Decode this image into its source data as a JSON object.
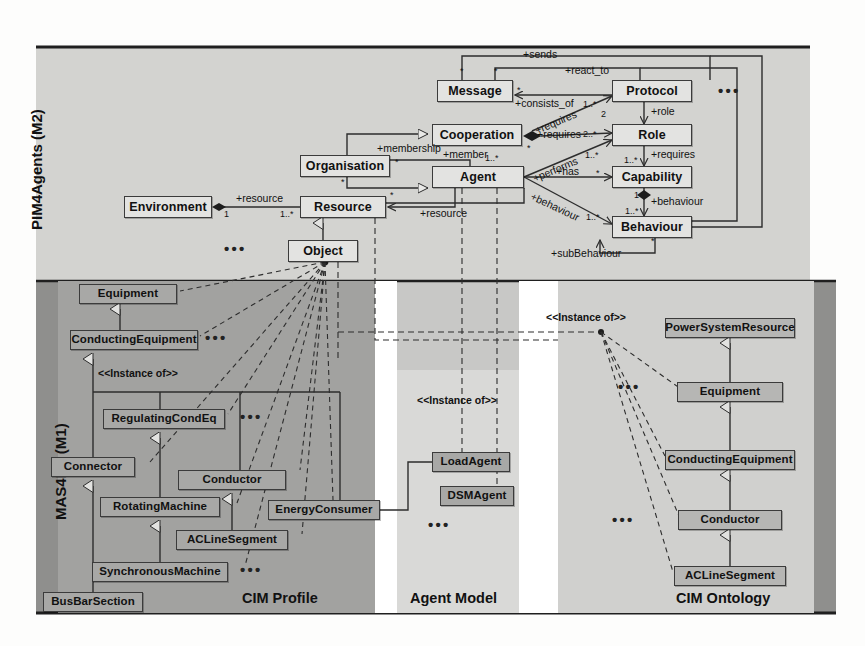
{
  "figure": {
    "layers": [
      {
        "id": "m2",
        "label": "PIM4Agents (M2)"
      },
      {
        "id": "m1",
        "label": "MAS4ES (M1)"
      }
    ],
    "panels": [
      {
        "id": "cim-profile",
        "title": "CIM Profile"
      },
      {
        "id": "agent-model",
        "title": "Agent Model"
      },
      {
        "id": "cim-ontology",
        "title": "CIM Ontology"
      }
    ]
  },
  "m2": {
    "classes": [
      {
        "id": "environment",
        "label": "Environment",
        "x": 124,
        "y": 196,
        "w": 88,
        "h": 22
      },
      {
        "id": "resource",
        "label": "Resource",
        "x": 300,
        "y": 196,
        "w": 86,
        "h": 22
      },
      {
        "id": "object",
        "label": "Object",
        "x": 288,
        "y": 240,
        "w": 70,
        "h": 22
      },
      {
        "id": "organisation",
        "label": "Organisation",
        "x": 300,
        "y": 155,
        "w": 90,
        "h": 22
      },
      {
        "id": "cooperation",
        "label": "Cooperation",
        "x": 432,
        "y": 124,
        "w": 90,
        "h": 22
      },
      {
        "id": "agent",
        "label": "Agent",
        "x": 432,
        "y": 166,
        "w": 92,
        "h": 22
      },
      {
        "id": "message",
        "label": "Message",
        "x": 437,
        "y": 80,
        "w": 76,
        "h": 22
      },
      {
        "id": "protocol",
        "label": "Protocol",
        "x": 612,
        "y": 80,
        "w": 80,
        "h": 22
      },
      {
        "id": "role",
        "label": "Role",
        "x": 612,
        "y": 124,
        "w": 80,
        "h": 22
      },
      {
        "id": "capability",
        "label": "Capability",
        "x": 612,
        "y": 166,
        "w": 80,
        "h": 22
      },
      {
        "id": "behaviour",
        "label": "Behaviour",
        "x": 612,
        "y": 216,
        "w": 80,
        "h": 22
      }
    ],
    "association_labels": [
      {
        "id": "sends",
        "text": "+sends",
        "x": 523,
        "y": 55
      },
      {
        "id": "react-to",
        "text": "+react_to",
        "x": 565,
        "y": 71
      },
      {
        "id": "consists-of",
        "text": "+consists_of",
        "x": 515,
        "y": 96
      },
      {
        "id": "requires-coop",
        "text": "+requires",
        "x": 498,
        "y": 108,
        "rotate": -22
      },
      {
        "id": "membership",
        "text": "+membership",
        "x": 377,
        "y": 143
      },
      {
        "id": "member",
        "text": "+member",
        "x": 442,
        "y": 147
      },
      {
        "id": "requires-role",
        "text": "+requires",
        "x": 537,
        "y": 134
      },
      {
        "id": "role-lbl",
        "text": "+role",
        "x": 651,
        "y": 111
      },
      {
        "id": "requires-cap",
        "text": "+requires",
        "x": 651,
        "y": 153
      },
      {
        "id": "performs",
        "text": "+performs",
        "x": 553,
        "y": 156,
        "rotate": -22
      },
      {
        "id": "has",
        "text": "+has",
        "x": 562,
        "y": 170
      },
      {
        "id": "behaviour-lnk",
        "text": "+behaviour",
        "x": 555,
        "y": 196,
        "rotate": 22
      },
      {
        "id": "behaviour-agg",
        "text": "+behaviour",
        "x": 650,
        "y": 201
      },
      {
        "id": "subbehaviour",
        "text": "+subBehaviour",
        "x": 560,
        "y": 244
      },
      {
        "id": "resource-env",
        "text": "+resource",
        "x": 240,
        "y": 192
      },
      {
        "id": "resource-ag",
        "text": "+resource",
        "x": 420,
        "y": 210
      }
    ],
    "multiplicities": [
      {
        "id": "env-1",
        "text": "1",
        "x": 222,
        "y": 210
      },
      {
        "id": "res-1n",
        "text": "1..*",
        "x": 283,
        "y": 210
      },
      {
        "id": "msg-star-a",
        "text": "*",
        "x": 466,
        "y": 70
      },
      {
        "id": "msg-star-b",
        "text": "*",
        "x": 500,
        "y": 70
      },
      {
        "id": "msg-star-c",
        "text": "*",
        "x": 516,
        "y": 88
      },
      {
        "id": "prot-req",
        "text": "1..*",
        "x": 586,
        "y": 103
      },
      {
        "id": "coop-star",
        "text": "*",
        "x": 527,
        "y": 146
      },
      {
        "id": "role-2n",
        "text": "2..*",
        "x": 585,
        "y": 134
      },
      {
        "id": "role-2",
        "text": "2",
        "x": 601,
        "y": 113
      },
      {
        "id": "role-1n",
        "text": "1..*",
        "x": 587,
        "y": 152
      },
      {
        "id": "cap-req-1n",
        "text": "1..*",
        "x": 601,
        "y": 156
      },
      {
        "id": "cap-star",
        "text": "*",
        "x": 597,
        "y": 170
      },
      {
        "id": "cap-1",
        "text": "1",
        "x": 638,
        "y": 190
      },
      {
        "id": "beh-1n-a",
        "text": "1..*",
        "x": 632,
        "y": 208
      },
      {
        "id": "beh-1n-b",
        "text": "1..*",
        "x": 587,
        "y": 214
      },
      {
        "id": "beh-star",
        "text": "*",
        "x": 653,
        "y": 236
      },
      {
        "id": "agent-1n",
        "text": "1..*",
        "x": 487,
        "y": 157
      },
      {
        "id": "org-star-a",
        "text": "*",
        "x": 396,
        "y": 160
      },
      {
        "id": "org-star-b",
        "text": "*",
        "x": 341,
        "y": 180
      },
      {
        "id": "res-star",
        "text": "*",
        "x": 391,
        "y": 192
      }
    ],
    "ellipses": [
      {
        "id": "m2-dots-right",
        "x": 722,
        "y": 88
      },
      {
        "id": "m2-dots-obj",
        "x": 228,
        "y": 246
      }
    ]
  },
  "m1": {
    "cim_profile": {
      "classes": [
        {
          "id": "equipment",
          "label": "Equipment",
          "x": 79,
          "y": 284,
          "w": 98,
          "h": 20
        },
        {
          "id": "conducting-equipment",
          "label": "ConductingEquipment",
          "x": 70,
          "y": 330,
          "w": 128,
          "h": 20
        },
        {
          "id": "regulating-condeq",
          "label": "RegulatingCondEq",
          "x": 103,
          "y": 409,
          "w": 122,
          "h": 20
        },
        {
          "id": "connector",
          "label": "Connector",
          "x": 65,
          "y": 457,
          "w": 84,
          "h": 20
        },
        {
          "id": "conductor",
          "label": "Conductor",
          "x": 187,
          "y": 470,
          "w": 108,
          "h": 20
        },
        {
          "id": "rotating-machine",
          "label": "RotatingMachine",
          "x": 112,
          "y": 497,
          "w": 120,
          "h": 20
        },
        {
          "id": "energy-consumer",
          "label": "EnergyConsumer",
          "x": 270,
          "y": 500,
          "w": 110,
          "h": 20
        },
        {
          "id": "acline-segment",
          "label": "ACLineSegment",
          "x": 185,
          "y": 530,
          "w": 112,
          "h": 20
        },
        {
          "id": "synchronous-machine",
          "label": "SynchronousMachine",
          "x": 105,
          "y": 562,
          "w": 136,
          "h": 20
        },
        {
          "id": "busbar-section",
          "label": "BusBarSection",
          "x": 70,
          "y": 592,
          "w": 100,
          "h": 20
        }
      ],
      "stereotype": {
        "text": "<<Instance of>>",
        "x": 98,
        "y": 373
      },
      "ellipses": [
        {
          "id": "dots-ce",
          "x": 208,
          "y": 334
        },
        {
          "id": "dots-rce",
          "x": 243,
          "y": 410
        },
        {
          "id": "dots-sm",
          "x": 250,
          "y": 566
        }
      ]
    },
    "agent_model": {
      "classes": [
        {
          "id": "load-agent",
          "label": "LoadAgent",
          "x": 432,
          "y": 452,
          "w": 76,
          "h": 20
        },
        {
          "id": "dsm-agent",
          "label": "DSMAgent",
          "x": 440,
          "y": 486,
          "w": 72,
          "h": 20
        }
      ],
      "stereotype": {
        "text": "<<Instance of>>",
        "x": 420,
        "y": 399
      },
      "ellipses": [
        {
          "id": "dots-agents",
          "x": 432,
          "y": 521
        }
      ]
    },
    "cim_ontology": {
      "classes": [
        {
          "id": "power-system-resource",
          "label": "PowerSystemResource",
          "x": 665,
          "y": 318,
          "w": 130,
          "h": 20
        },
        {
          "id": "equipment-o",
          "label": "Equipment",
          "x": 681,
          "y": 382,
          "w": 106,
          "h": 20
        },
        {
          "id": "conducting-equipment-o",
          "label": "ConductingEquipment",
          "x": 665,
          "y": 450,
          "w": 128,
          "h": 20
        },
        {
          "id": "conductor-o",
          "label": "Conductor",
          "x": 679,
          "y": 510,
          "w": 104,
          "h": 20
        },
        {
          "id": "acline-segment-o",
          "label": "ACLineSegment",
          "x": 673,
          "y": 566,
          "w": 112,
          "h": 20
        }
      ],
      "stereotype": {
        "text": "<<Instance of>>",
        "x": 545,
        "y": 307
      },
      "ellipses": [
        {
          "id": "dots-onto-top",
          "x": 622,
          "y": 383
        },
        {
          "id": "dots-onto-bot",
          "x": 618,
          "y": 516
        }
      ]
    }
  },
  "colors": {
    "m2_panel": "#d3d3d0",
    "m1_panel": "#c8c8c6",
    "m1_band": "#9c9c9a",
    "cim_profile_panel": "#a2a2a0",
    "agent_model_panel": "#d9d9d7",
    "cim_ontology_panel": "#d0d0ce",
    "box_m2": "#e3e3e1",
    "box_m1": "#a8a8a6",
    "box_onto": "#b6b6b4",
    "line": "#2d2d2d",
    "page": "#fdfdfc"
  }
}
